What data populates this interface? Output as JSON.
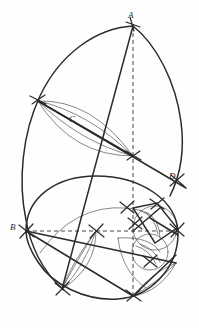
{
  "figure": {
    "canvas": {
      "width": 199,
      "height": 328
    },
    "background_color": "#fefefe",
    "ink_color": "#2b2b2b",
    "light_ink_color": "#555555",
    "heavy_stroke_width": 1.5,
    "light_stroke_width": 0.7,
    "dashed_pattern": "4,3"
  },
  "labels": [
    {
      "id": "A",
      "text": "A",
      "x": 128,
      "y": 11,
      "note": "apex point at top of figure"
    },
    {
      "id": "C",
      "text": "C",
      "x": 69,
      "y": 115,
      "note": "point on upper lens/vesica"
    },
    {
      "id": "D",
      "text": "D",
      "x": 169,
      "y": 172,
      "note": "point on lower right ray"
    },
    {
      "id": "B",
      "text": "B",
      "x": 10,
      "y": 223,
      "note": "left point on large lower circle"
    }
  ],
  "points": {
    "A": {
      "x": 133,
      "y": 26
    },
    "B": {
      "x": 26,
      "y": 231
    },
    "C": {
      "x": 74,
      "y": 121
    },
    "D": {
      "x": 177,
      "y": 180
    },
    "left_node": {
      "x": 38,
      "y": 101
    },
    "mid_node": {
      "x": 133,
      "y": 156
    },
    "center_lower": {
      "x": 96,
      "y": 231
    },
    "bottom_node": {
      "x": 133,
      "y": 296
    },
    "lower_left_node": {
      "x": 62,
      "y": 289
    },
    "right_node": {
      "x": 176,
      "y": 231
    },
    "small_top_node": {
      "x": 157,
      "y": 206
    },
    "small_bottom_node": {
      "x": 150,
      "y": 262
    }
  },
  "elements": {
    "main_outline_label": "large oval outline",
    "right_arc_label": "right outer arc from A to D region",
    "lower_circle_label": "large lower circle through B",
    "small_circle_label": "small circle at lower right",
    "vesica_label": "upper lens (vesica) through C",
    "lower_vesica_label": "lower lens arcs",
    "dashed_vertical_label": "vertical dashed axis through A",
    "dashed_horizontal_label": "horizontal dashed axis through B"
  },
  "construction_marks": {
    "count": 12,
    "description": "compass intersection tick crosses"
  }
}
